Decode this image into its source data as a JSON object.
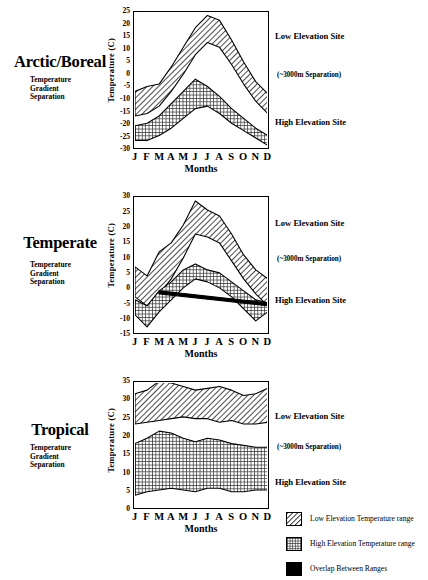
{
  "figure": {
    "months": [
      "J",
      "F",
      "M",
      "A",
      "M",
      "J",
      "J",
      "A",
      "S",
      "O",
      "N",
      "D"
    ],
    "months_axis_title": "Months",
    "y_axis_title": "Temperature (C)",
    "subtitle_line1": "Temperature",
    "subtitle_line2": "Gradient",
    "subtitle_line3": "Separation",
    "note_low": "Low Elevation Site",
    "note_sep": "(~3000m  Separation)",
    "note_high": "High Elevation Site"
  },
  "legend": {
    "items": [
      {
        "label": "Low Elevation Temperature range",
        "pattern": "diagonal-hatch"
      },
      {
        "label": "High Elevation Temperature range",
        "pattern": "cross-hatch"
      },
      {
        "label": "Overlap Between Ranges",
        "pattern": "solid-black"
      }
    ]
  },
  "panels": [
    {
      "key": "arctic",
      "title": "Arctic/Boreal"
    },
    {
      "key": "temperate",
      "title": "Temperate"
    },
    {
      "key": "tropical",
      "title": "Tropical"
    }
  ],
  "chart_data": [
    {
      "type": "area",
      "title": "Arctic/Boreal",
      "xlabel": "Months",
      "ylabel": "Temperature (C)",
      "ylim": [
        -30,
        25
      ],
      "yticks": [
        25,
        20,
        15,
        10,
        5,
        0,
        -5,
        -10,
        -15,
        -20,
        -25,
        -30
      ],
      "categories": [
        "J",
        "F",
        "M",
        "A",
        "M",
        "J",
        "J",
        "A",
        "S",
        "O",
        "N",
        "D"
      ],
      "grid": false,
      "legend_position": "bottom-right",
      "series": [
        {
          "name": "Low Elevation max",
          "values": [
            -7,
            -5,
            -4,
            3,
            11,
            19,
            24,
            22,
            14,
            5,
            -3,
            -8
          ]
        },
        {
          "name": "Low Elevation min",
          "values": [
            -17,
            -16,
            -13,
            -7,
            0,
            8,
            13,
            11,
            4,
            -4,
            -11,
            -16
          ]
        },
        {
          "name": "High Elevation max",
          "values": [
            -21,
            -20,
            -17,
            -12,
            -7,
            -2,
            -5,
            -9,
            -14,
            -18,
            -22,
            -25
          ]
        },
        {
          "name": "High Elevation min",
          "values": [
            -27,
            -27,
            -25,
            -22,
            -18,
            -14,
            -13,
            -16,
            -20,
            -23,
            -26,
            -29
          ]
        }
      ],
      "annotations": [
        "Low Elevation Site",
        "(~3000m  Separation)",
        "High Elevation Site"
      ]
    },
    {
      "type": "area",
      "title": "Temperate",
      "xlabel": "Months",
      "ylabel": "Temperature (C)",
      "ylim": [
        -15,
        30
      ],
      "yticks": [
        30,
        25,
        20,
        15,
        10,
        5,
        0,
        -5,
        -10,
        -15
      ],
      "categories": [
        "J",
        "F",
        "M",
        "A",
        "M",
        "J",
        "J",
        "A",
        "S",
        "O",
        "N",
        "D"
      ],
      "grid": false,
      "legend_position": "bottom-right",
      "series": [
        {
          "name": "Low Elevation max",
          "values": [
            7,
            4,
            12,
            15,
            21,
            29,
            26,
            24,
            18,
            11,
            6,
            3
          ]
        },
        {
          "name": "Low Elevation min",
          "values": [
            -3,
            -6,
            -2,
            3,
            10,
            18,
            17,
            15,
            9,
            3,
            -2,
            -6
          ]
        },
        {
          "name": "High Elevation max",
          "values": [
            -4,
            -6,
            -1,
            2,
            6,
            8,
            6,
            5,
            2,
            -1,
            -4,
            -5
          ]
        },
        {
          "name": "High Elevation min",
          "values": [
            -9,
            -13,
            -8,
            -4,
            0,
            3,
            2,
            0,
            -3,
            -7,
            -11,
            -8
          ]
        }
      ],
      "annotations": [
        "Low Elevation Site",
        "(~3000m  Separation)",
        "High Elevation Site"
      ]
    },
    {
      "type": "area",
      "title": "Tropical",
      "xlabel": "Months",
      "ylabel": "Temperature (C)",
      "ylim": [
        0,
        35
      ],
      "yticks": [
        35,
        30,
        25,
        20,
        15,
        10,
        5,
        0
      ],
      "categories": [
        "J",
        "F",
        "M",
        "A",
        "M",
        "J",
        "J",
        "A",
        "S",
        "O",
        "N",
        "D"
      ],
      "grid": false,
      "legend_position": "bottom-right",
      "series": [
        {
          "name": "Low Elevation max",
          "values": [
            32,
            33,
            35.5,
            35,
            34,
            33,
            33.5,
            34,
            33,
            31.5,
            32,
            33.5
          ]
        },
        {
          "name": "Low Elevation min",
          "values": [
            23.5,
            24,
            24.5,
            25,
            25.5,
            25,
            25,
            24,
            24.5,
            23.5,
            23.5,
            24
          ]
        },
        {
          "name": "High Elevation max",
          "values": [
            18,
            19.5,
            21.5,
            21,
            19.5,
            18.5,
            19.5,
            19,
            18,
            17.5,
            17,
            17
          ]
        },
        {
          "name": "High Elevation min",
          "values": [
            3.5,
            4.5,
            5,
            5.5,
            5,
            4.5,
            5.5,
            5.5,
            4.5,
            4.5,
            5,
            5
          ]
        }
      ],
      "annotations": [
        "Low Elevation Site",
        "(~3000m  Separation)",
        "High Elevation Site"
      ]
    }
  ]
}
